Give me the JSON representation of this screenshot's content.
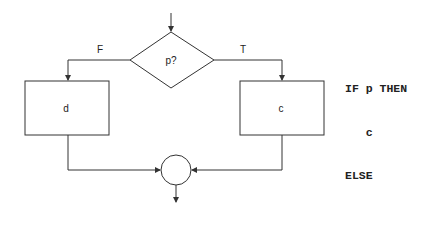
{
  "diagram": {
    "decision": {
      "label": "p?"
    },
    "branches": {
      "false_label": "F",
      "true_label": "T"
    },
    "false_box": {
      "label": "d"
    },
    "true_box": {
      "label": "c"
    },
    "junction": "circle"
  },
  "code": {
    "lines": [
      "IF p THEN",
      "   c",
      "ELSE",
      "   d",
      "ENDIF"
    ]
  },
  "colors": {
    "stroke": "#333333",
    "text": "#222222",
    "background": "#ffffff"
  }
}
